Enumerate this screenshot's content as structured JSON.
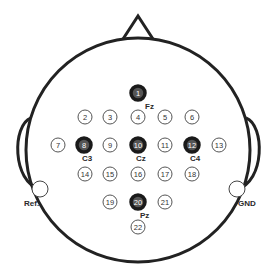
{
  "diagram": {
    "type": "eeg-electrode-montage",
    "colors": {
      "line": "#222222",
      "background": "#ffffff",
      "electrode_outline": "#444444"
    },
    "head": {
      "cx": 138,
      "cy": 150,
      "r": 112
    },
    "electrodes": [
      {
        "n": "1",
        "x": 138,
        "y": 93,
        "active": true,
        "label": "Fz"
      },
      {
        "n": "2",
        "x": 85,
        "y": 117,
        "active": false
      },
      {
        "n": "3",
        "x": 110,
        "y": 117,
        "active": false
      },
      {
        "n": "4",
        "x": 138,
        "y": 117,
        "active": false
      },
      {
        "n": "5",
        "x": 165,
        "y": 117,
        "active": false
      },
      {
        "n": "6",
        "x": 192,
        "y": 117,
        "active": false
      },
      {
        "n": "7",
        "x": 58,
        "y": 145,
        "active": false
      },
      {
        "n": "8",
        "x": 84,
        "y": 145,
        "active": true,
        "label": "C3"
      },
      {
        "n": "9",
        "x": 110,
        "y": 145,
        "active": false
      },
      {
        "n": "10",
        "x": 138,
        "y": 145,
        "active": true,
        "label": "Cz"
      },
      {
        "n": "11",
        "x": 165,
        "y": 145,
        "active": false
      },
      {
        "n": "12",
        "x": 192,
        "y": 145,
        "active": true,
        "label": "C4"
      },
      {
        "n": "13",
        "x": 219,
        "y": 145,
        "active": false
      },
      {
        "n": "14",
        "x": 85,
        "y": 174,
        "active": false
      },
      {
        "n": "15",
        "x": 110,
        "y": 174,
        "active": false
      },
      {
        "n": "16",
        "x": 138,
        "y": 174,
        "active": false
      },
      {
        "n": "17",
        "x": 165,
        "y": 174,
        "active": false
      },
      {
        "n": "18",
        "x": 192,
        "y": 174,
        "active": false
      },
      {
        "n": "19",
        "x": 110,
        "y": 202,
        "active": false
      },
      {
        "n": "20",
        "x": 138,
        "y": 202,
        "active": true,
        "label": "Pz"
      },
      {
        "n": "21",
        "x": 165,
        "y": 202,
        "active": false
      },
      {
        "n": "22",
        "x": 138,
        "y": 227,
        "active": false
      }
    ],
    "reference": {
      "label": "Ref.",
      "x": 40,
      "y": 189
    },
    "ground": {
      "label": "GND",
      "x": 237,
      "y": 189
    }
  }
}
